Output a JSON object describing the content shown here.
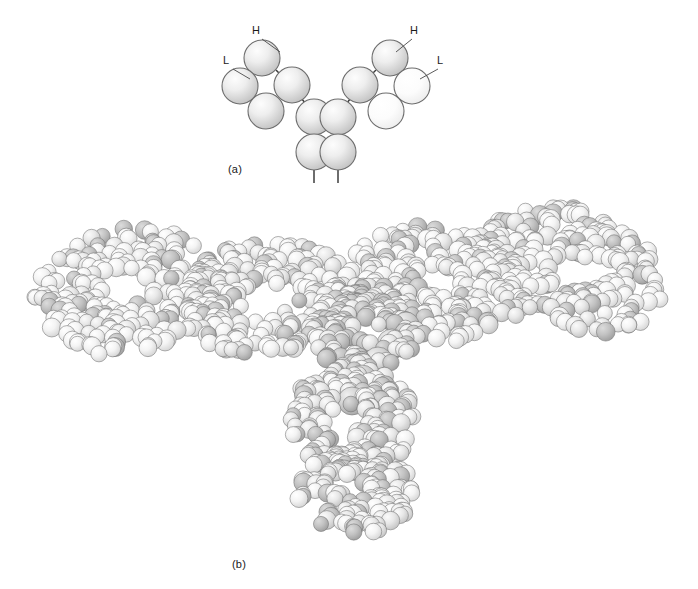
{
  "figure": {
    "background_color": "#ffffff",
    "width": 698,
    "height": 589,
    "panels": [
      {
        "id": "a",
        "caption": "(a)",
        "description": "Schematic domain model of an IgG antibody drawn as shaded spheres joined by short connecting segments in a Y shape"
      },
      {
        "id": "b",
        "caption": "(b)",
        "description": "Space-filling (van der Waals) atomic model of the same antibody in the same Y orientation"
      }
    ]
  },
  "panel_a": {
    "caption": "(a)",
    "caption_x": 228,
    "caption_y": 163,
    "labels": [
      {
        "name": "heavy-chain-left",
        "text": "H",
        "x": 256,
        "y": 34,
        "leader_x1": 262,
        "leader_y1": 39,
        "leader_x2": 280,
        "leader_y2": 52
      },
      {
        "name": "light-chain-left",
        "text": "L",
        "x": 226,
        "y": 64,
        "leader_x1": 233,
        "leader_y1": 69,
        "leader_x2": 250,
        "leader_y2": 79
      },
      {
        "name": "heavy-chain-right",
        "text": "H",
        "x": 414,
        "y": 34,
        "leader_x1": 412,
        "leader_y1": 39,
        "leader_x2": 396,
        "leader_y2": 52
      },
      {
        "name": "light-chain-right",
        "text": "L",
        "x": 440,
        "y": 64,
        "leader_x1": 438,
        "leader_y1": 69,
        "leader_x2": 420,
        "leader_y2": 79
      }
    ],
    "domain_radius": 18,
    "colors": {
      "heavy_light_edge": "#6d6d6d",
      "heavy_fill_center": "#fbfbfb",
      "heavy_fill_edge": "#c3c3c3",
      "light_fill_center": "#ffffff",
      "light_fill_edge": "#ededed",
      "connector": "#3c3c3c"
    },
    "domains": [
      {
        "name": "VH-left",
        "chain": "heavy",
        "x": 262,
        "y": 58,
        "r": 18
      },
      {
        "name": "VL-left",
        "chain": "heavy",
        "x": 240,
        "y": 86,
        "r": 18
      },
      {
        "name": "CH1-left",
        "chain": "heavy",
        "x": 292,
        "y": 85,
        "r": 18
      },
      {
        "name": "CL-left",
        "chain": "heavy",
        "x": 266,
        "y": 111,
        "r": 18
      },
      {
        "name": "CH2-left",
        "chain": "heavy",
        "x": 314,
        "y": 117,
        "r": 18
      },
      {
        "name": "CH3-left",
        "chain": "heavy",
        "x": 314,
        "y": 152,
        "r": 18
      },
      {
        "name": "VH-right",
        "chain": "heavy",
        "x": 390,
        "y": 58,
        "r": 18
      },
      {
        "name": "VL-right",
        "chain": "light",
        "x": 412,
        "y": 86,
        "r": 18
      },
      {
        "name": "CH1-right",
        "chain": "heavy",
        "x": 360,
        "y": 85,
        "r": 18
      },
      {
        "name": "CL-right",
        "chain": "light",
        "x": 386,
        "y": 111,
        "r": 18
      },
      {
        "name": "CH2-right",
        "chain": "heavy",
        "x": 338,
        "y": 117,
        "r": 18
      },
      {
        "name": "CH3-right",
        "chain": "heavy",
        "x": 338,
        "y": 152,
        "r": 18
      }
    ],
    "connectors": [
      {
        "name": "link-VH-CH1-left",
        "x1": 276,
        "y1": 70,
        "x2": 281,
        "y2": 75
      },
      {
        "name": "link-VL-CL-left",
        "x1": 251,
        "y1": 98,
        "x2": 256,
        "y2": 102
      },
      {
        "name": "link-CH1-CH2-left",
        "x1": 301,
        "y1": 98,
        "x2": 306,
        "y2": 104
      },
      {
        "name": "link-CH2-CH3-left",
        "x1": 314,
        "y1": 135,
        "x2": 314,
        "y2": 135
      },
      {
        "name": "tail-left",
        "x1": 314,
        "y1": 170,
        "x2": 314,
        "y2": 183
      },
      {
        "name": "link-VH-CH1-right",
        "x1": 376,
        "y1": 70,
        "x2": 371,
        "y2": 75
      },
      {
        "name": "link-VL-CL-right",
        "x1": 401,
        "y1": 98,
        "x2": 396,
        "y2": 102
      },
      {
        "name": "link-CH1-CH2-right",
        "x1": 351,
        "y1": 98,
        "x2": 346,
        "y2": 104
      },
      {
        "name": "link-CH2-CH3-right",
        "x1": 338,
        "y1": 135,
        "x2": 338,
        "y2": 135
      },
      {
        "name": "tail-right",
        "x1": 338,
        "y1": 170,
        "x2": 338,
        "y2": 183
      }
    ]
  },
  "panel_b": {
    "caption": "(b)",
    "caption_x": 232,
    "caption_y": 558,
    "bounds": {
      "x": 22,
      "y": 198,
      "width": 654,
      "height": 352
    },
    "atom_radius_min": 7.5,
    "atom_radius_max": 9.5,
    "large_atom_radius": 14,
    "colors": {
      "atom_edge": "#707070",
      "atom_light_center": "#ffffff",
      "atom_light_edge": "#dcdcdc",
      "atom_mid_center": "#f6f6f6",
      "atom_mid_edge": "#c8c8c8",
      "atom_dark_center": "#cfcfcf",
      "atom_dark_edge": "#9a9a9a"
    },
    "lobes": [
      {
        "name": "fab-left-distal",
        "cx": 128,
        "cy": 290,
        "rx": 96,
        "ry": 62,
        "rot": -14,
        "count": 210,
        "shade": "light"
      },
      {
        "name": "fab-left-proximal",
        "cx": 268,
        "cy": 300,
        "rx": 86,
        "ry": 60,
        "rot": -6,
        "count": 195,
        "shade": "light"
      },
      {
        "name": "fab-right-proximal",
        "cx": 438,
        "cy": 282,
        "rx": 88,
        "ry": 58,
        "rot": 10,
        "count": 195,
        "shade": "light"
      },
      {
        "name": "fab-right-distal",
        "cx": 572,
        "cy": 270,
        "rx": 94,
        "ry": 60,
        "rot": 16,
        "count": 205,
        "shade": "light"
      },
      {
        "name": "hinge-core",
        "cx": 366,
        "cy": 330,
        "rx": 52,
        "ry": 46,
        "rot": 0,
        "count": 120,
        "shade": "dark"
      },
      {
        "name": "fc-upper",
        "cx": 352,
        "cy": 420,
        "rx": 64,
        "ry": 52,
        "rot": 0,
        "count": 150,
        "shade": "mid"
      },
      {
        "name": "fc-lower",
        "cx": 356,
        "cy": 492,
        "rx": 58,
        "ry": 42,
        "rot": 0,
        "count": 130,
        "shade": "mid"
      }
    ],
    "highlight_atoms": [
      {
        "name": "carbohydrate-atom-1",
        "cx": 392,
        "cy": 344,
        "r": 15
      },
      {
        "name": "carbohydrate-atom-2",
        "cx": 378,
        "cy": 362,
        "r": 15
      },
      {
        "name": "carbohydrate-atom-3",
        "cx": 362,
        "cy": 380,
        "r": 15
      },
      {
        "name": "carbohydrate-atom-4",
        "cx": 352,
        "cy": 401,
        "r": 14
      },
      {
        "name": "carbohydrate-atom-5",
        "cx": 406,
        "cy": 325,
        "r": 13
      }
    ]
  }
}
